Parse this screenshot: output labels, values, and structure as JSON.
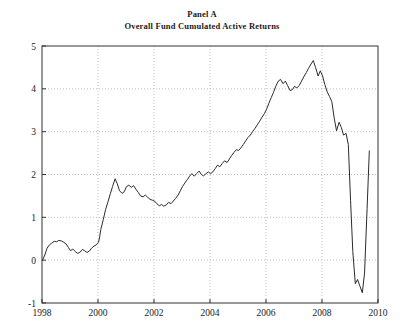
{
  "chart_data": {
    "type": "line",
    "title": "Panel A",
    "subtitle": "Overall Fund Cumulated Active Returns",
    "xlabel": "",
    "ylabel": "",
    "xlim": [
      1998,
      2010
    ],
    "ylim": [
      -1,
      5
    ],
    "xticks": [
      1998,
      2000,
      2002,
      2004,
      2006,
      2008,
      2010
    ],
    "xtick_labels": [
      "1998",
      "2000",
      "2002",
      "2004",
      "2006",
      "2008",
      "2010"
    ],
    "yticks": [
      -1,
      0,
      1,
      2,
      3,
      4,
      5
    ],
    "ytick_labels": [
      "-1",
      "0",
      "1",
      "2",
      "3",
      "4",
      "5"
    ],
    "grid": true,
    "grid_style": "dotted",
    "grid_color": "#b0b0b0",
    "line_color": "#2b2b2b",
    "line_width": 1,
    "legend": null,
    "series": [
      {
        "name": "Overall Fund Cumulated Active Returns",
        "x": [
          1998.02,
          1998.1,
          1998.18,
          1998.27,
          1998.35,
          1998.44,
          1998.52,
          1998.6,
          1998.69,
          1998.77,
          1998.86,
          1998.94,
          1999.02,
          1999.1,
          1999.19,
          1999.27,
          1999.35,
          1999.44,
          1999.52,
          1999.61,
          1999.69,
          1999.77,
          1999.86,
          1999.94,
          2000.02,
          2000.06,
          2000.1,
          2000.19,
          2000.27,
          2000.35,
          2000.44,
          2000.52,
          2000.61,
          2000.69,
          2000.77,
          2000.86,
          2000.94,
          2001.02,
          2001.1,
          2001.19,
          2001.27,
          2001.35,
          2001.44,
          2001.52,
          2001.61,
          2001.69,
          2001.77,
          2001.86,
          2001.94,
          2002.02,
          2002.1,
          2002.19,
          2002.27,
          2002.35,
          2002.44,
          2002.52,
          2002.61,
          2002.69,
          2002.77,
          2002.86,
          2002.94,
          2003.02,
          2003.1,
          2003.19,
          2003.27,
          2003.35,
          2003.44,
          2003.52,
          2003.61,
          2003.69,
          2003.77,
          2003.86,
          2003.94,
          2004.02,
          2004.1,
          2004.19,
          2004.27,
          2004.35,
          2004.44,
          2004.52,
          2004.61,
          2004.69,
          2004.77,
          2004.86,
          2004.94,
          2005.02,
          2005.1,
          2005.19,
          2005.27,
          2005.35,
          2005.44,
          2005.52,
          2005.61,
          2005.69,
          2005.77,
          2005.86,
          2005.94,
          2006.02,
          2006.1,
          2006.19,
          2006.27,
          2006.35,
          2006.44,
          2006.52,
          2006.61,
          2006.69,
          2006.77,
          2006.86,
          2006.94,
          2007.02,
          2007.1,
          2007.19,
          2007.27,
          2007.35,
          2007.44,
          2007.52,
          2007.61,
          2007.69,
          2007.77,
          2007.86,
          2007.94,
          2008.02,
          2008.1,
          2008.19,
          2008.27,
          2008.35,
          2008.44,
          2008.52,
          2008.61,
          2008.69,
          2008.77,
          2008.86,
          2008.94,
          2009.02,
          2009.1,
          2009.19,
          2009.27,
          2009.35,
          2009.44,
          2009.52,
          2009.61,
          2009.69
        ],
        "y": [
          0.0,
          0.12,
          0.28,
          0.36,
          0.4,
          0.44,
          0.43,
          0.46,
          0.45,
          0.42,
          0.38,
          0.3,
          0.22,
          0.26,
          0.2,
          0.16,
          0.18,
          0.25,
          0.22,
          0.18,
          0.21,
          0.28,
          0.33,
          0.36,
          0.42,
          0.55,
          0.72,
          0.95,
          1.18,
          1.35,
          1.55,
          1.72,
          1.9,
          1.78,
          1.62,
          1.56,
          1.6,
          1.72,
          1.75,
          1.7,
          1.74,
          1.66,
          1.58,
          1.5,
          1.48,
          1.52,
          1.47,
          1.42,
          1.4,
          1.38,
          1.32,
          1.27,
          1.3,
          1.26,
          1.29,
          1.35,
          1.32,
          1.38,
          1.44,
          1.52,
          1.62,
          1.72,
          1.8,
          1.88,
          1.96,
          2.02,
          1.96,
          2.02,
          2.08,
          2.0,
          1.97,
          2.02,
          2.06,
          2.02,
          2.06,
          2.14,
          2.22,
          2.18,
          2.26,
          2.32,
          2.28,
          2.36,
          2.44,
          2.52,
          2.58,
          2.56,
          2.62,
          2.7,
          2.78,
          2.86,
          2.92,
          3.0,
          3.08,
          3.16,
          3.24,
          3.34,
          3.42,
          3.52,
          3.66,
          3.8,
          3.92,
          4.06,
          4.18,
          4.22,
          4.12,
          4.18,
          4.08,
          3.96,
          3.98,
          4.06,
          4.02,
          4.08,
          4.18,
          4.28,
          4.38,
          4.48,
          4.58,
          4.66,
          4.5,
          4.3,
          4.42,
          4.3,
          4.1,
          3.92,
          3.82,
          3.7,
          3.3,
          3.02,
          3.22,
          3.1,
          2.92,
          2.96,
          2.7,
          1.4,
          0.2,
          -0.55,
          -0.45,
          -0.6,
          -0.76,
          -0.3,
          1.2,
          2.55
        ]
      }
    ]
  }
}
